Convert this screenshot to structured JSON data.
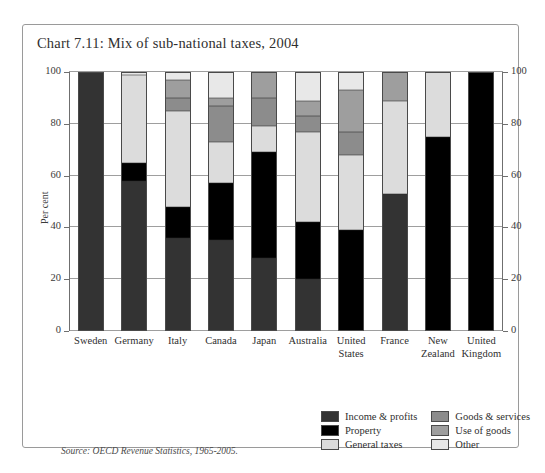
{
  "chart_data": {
    "type": "bar",
    "title": "Chart 7.11: Mix of sub-national taxes, 2004",
    "subtype": "100% stacked bar",
    "xlabel": "",
    "ylabel": "Per cent",
    "ylim": [
      0,
      100
    ],
    "yticks": [
      0,
      20,
      40,
      60,
      80,
      100
    ],
    "ytick_labels": [
      "0",
      "20",
      "40",
      "60",
      "80",
      "100"
    ],
    "grid": true,
    "dual_axis": true,
    "legend_position": "bottom-right",
    "source": "Source: OECD Revenue Statistics, 1965-2005.",
    "categories": [
      "Sweden",
      "Germany",
      "Italy",
      "Canada",
      "Japan",
      "Australia",
      "United States",
      "France",
      "New Zealand",
      "United Kingdom"
    ],
    "category_labels": [
      [
        "Sweden"
      ],
      [
        "Germany"
      ],
      [
        "Italy"
      ],
      [
        "Canada"
      ],
      [
        "Japan"
      ],
      [
        "Australia"
      ],
      [
        "United",
        "States"
      ],
      [
        "France"
      ],
      [
        "New",
        "Zealand"
      ],
      [
        "United",
        "Kingdom"
      ]
    ],
    "series": [
      {
        "name": "Income & profits",
        "color": "#333333",
        "values": [
          100,
          58,
          36,
          35,
          28,
          20,
          0,
          53,
          0,
          0
        ]
      },
      {
        "name": "Property",
        "color": "#000000",
        "values": [
          0,
          7,
          12,
          22,
          41,
          22,
          39,
          0,
          75,
          100
        ]
      },
      {
        "name": "General taxes",
        "color": "#dcdcdc",
        "values": [
          0,
          34,
          37,
          16,
          10,
          35,
          29,
          36,
          25,
          0
        ]
      },
      {
        "name": "Goods & services",
        "color": "#8c8c8c",
        "values": [
          0,
          0,
          5,
          14,
          11,
          6,
          9,
          0,
          0,
          0
        ]
      },
      {
        "name": "Use of goods",
        "color": "#9e9e9e",
        "values": [
          0,
          0,
          7,
          3,
          10,
          6,
          16,
          11,
          0,
          0
        ]
      },
      {
        "name": "Other",
        "color": "#e8e8e8",
        "values": [
          0,
          1,
          3,
          10,
          0,
          11,
          7,
          0,
          0,
          0
        ]
      }
    ]
  },
  "legend": {
    "left_column": [
      {
        "label": "Income & profits",
        "color": "#333333"
      },
      {
        "label": "Property",
        "color": "#000000"
      },
      {
        "label": "General taxes",
        "color": "#dcdcdc"
      }
    ],
    "right_column": [
      {
        "label": "Goods & services",
        "color": "#8c8c8c"
      },
      {
        "label": "Use of goods",
        "color": "#9e9e9e"
      },
      {
        "label": "Other",
        "color": "#e8e8e8"
      }
    ]
  }
}
